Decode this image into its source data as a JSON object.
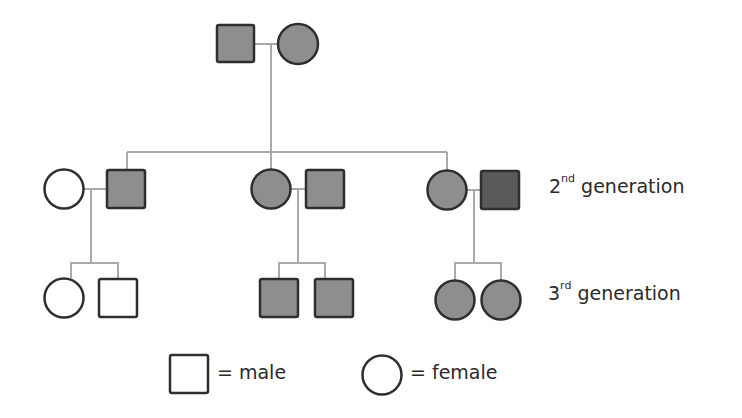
{
  "diagram": {
    "type": "pedigree-chart",
    "colors": {
      "line": "#a9a9a9",
      "stroke": "#2e2e2e",
      "affected_fill": "#8e8e8e",
      "dark_fill": "#5a5a5a",
      "unaffected_fill": "#ffffff"
    },
    "generations": [
      {
        "id": "gen1",
        "label": "",
        "members": [
          {
            "id": "g1-father",
            "sex": "male",
            "status": "affected"
          },
          {
            "id": "g1-mother",
            "sex": "female",
            "status": "affected"
          }
        ]
      },
      {
        "id": "gen2",
        "label_num": "2",
        "label_sup": "nd",
        "label_text": " generation",
        "couples": [
          {
            "spouse": {
              "sex": "female",
              "status": "unaffected"
            },
            "child_of_gen1": {
              "sex": "male",
              "status": "affected"
            }
          },
          {
            "child_of_gen1": {
              "sex": "female",
              "status": "affected"
            },
            "spouse": {
              "sex": "male",
              "status": "affected"
            }
          },
          {
            "child_of_gen1": {
              "sex": "female",
              "status": "affected"
            },
            "spouse": {
              "sex": "male",
              "status": "affected-dark"
            }
          }
        ]
      },
      {
        "id": "gen3",
        "label_num": "3",
        "label_sup": "rd",
        "label_text": " generation",
        "sibships": [
          {
            "children": [
              {
                "sex": "female",
                "status": "unaffected"
              },
              {
                "sex": "male",
                "status": "unaffected"
              }
            ]
          },
          {
            "children": [
              {
                "sex": "male",
                "status": "affected"
              },
              {
                "sex": "male",
                "status": "affected"
              }
            ]
          },
          {
            "children": [
              {
                "sex": "female",
                "status": "affected"
              },
              {
                "sex": "female",
                "status": "affected"
              }
            ]
          }
        ]
      }
    ],
    "legend": {
      "male_label": "= male",
      "female_label": "= female"
    }
  }
}
